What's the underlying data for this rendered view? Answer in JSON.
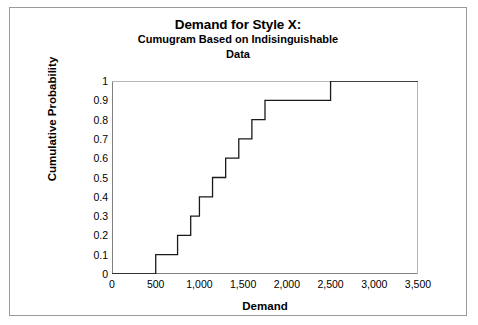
{
  "figure": {
    "border_color": "#9a9a9a",
    "background": "#ffffff"
  },
  "chart_data": {
    "type": "line",
    "step": "post",
    "title": "Demand for Style X:",
    "subtitle": "Cumugram Based on Indisinguishable Data",
    "title_line1": "Demand for Style X:",
    "title_line2": "Cumugram Based on Indisinguishable",
    "title_line3": "Data",
    "xlabel": "Demand",
    "ylabel": "Cumulative Probability",
    "xlim": [
      0,
      3500
    ],
    "ylim": [
      0,
      1
    ],
    "grid": false,
    "legend": null,
    "line_color": "#1a1a1a",
    "line_width": 1.3,
    "xticks": [
      0,
      500,
      1000,
      1500,
      2000,
      2500,
      3000,
      3500
    ],
    "xticklabels": [
      "0",
      "500",
      "1,000",
      "1,500",
      "2,000",
      "2,500",
      "3,000",
      "3,500"
    ],
    "yticks": [
      0,
      0.1,
      0.2,
      0.3,
      0.4,
      0.5,
      0.6,
      0.7,
      0.8,
      0.9,
      1
    ],
    "yticklabels": [
      "0",
      "0.1",
      "0.2",
      "0.3",
      "0.4",
      "0.5",
      "0.6",
      "0.7",
      "0.8",
      "0.9",
      "1"
    ],
    "x": [
      0,
      500,
      750,
      900,
      1000,
      1150,
      1300,
      1450,
      1600,
      1750,
      1900,
      2100,
      2500,
      3500
    ],
    "y": [
      0,
      0.1,
      0.2,
      0.3,
      0.4,
      0.5,
      0.6,
      0.7,
      0.8,
      0.9,
      0.9,
      0.9,
      1.0,
      1.0
    ],
    "jump_points": [
      {
        "demand": 500,
        "cumulative_probability": 0.1
      },
      {
        "demand": 750,
        "cumulative_probability": 0.2
      },
      {
        "demand": 900,
        "cumulative_probability": 0.3
      },
      {
        "demand": 1000,
        "cumulative_probability": 0.4
      },
      {
        "demand": 1150,
        "cumulative_probability": 0.5
      },
      {
        "demand": 1300,
        "cumulative_probability": 0.6
      },
      {
        "demand": 1450,
        "cumulative_probability": 0.7
      },
      {
        "demand": 1600,
        "cumulative_probability": 0.8
      },
      {
        "demand": 1900,
        "cumulative_probability": 0.9
      },
      {
        "demand": 2500,
        "cumulative_probability": 1.0
      }
    ]
  }
}
